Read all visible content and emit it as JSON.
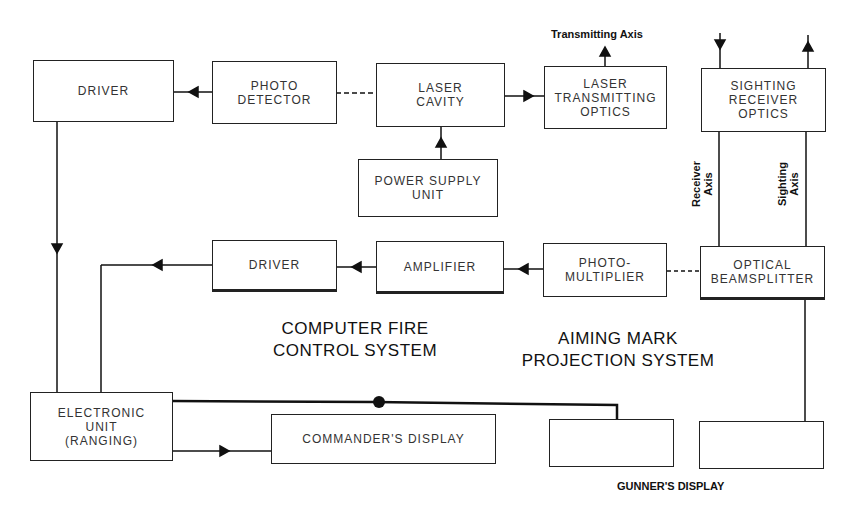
{
  "diagram": {
    "blocks": {
      "driver_top": "DRIVER",
      "photo_detector": "PHOTO\nDETECTOR",
      "laser_cavity": "LASER\nCAVITY",
      "laser_transmitting_optics": "LASER\nTRANSMITTING\nOPTICS",
      "sighting_receiver_optics": "SIGHTING\nRECEIVER\nOPTICS",
      "power_supply_unit": "POWER SUPPLY\nUNIT",
      "driver_mid": "DRIVER",
      "amplifier": "AMPLIFIER",
      "photo_multiplier": "PHOTO-\nMULTIPLIER",
      "optical_beamsplitter": "OPTICAL\nBEAMSPLITTER",
      "electronic_unit": "ELECTRONIC\nUNIT\n(RANGING)",
      "commanders_display": "COMMANDER'S DISPLAY",
      "gunner_display_left": "",
      "gunner_display_right": ""
    },
    "labels": {
      "transmitting_axis": "Transmitting Axis",
      "receiver_axis": "Receiver\nAxis",
      "sighting_axis": "Sighting\nAxis",
      "computer_fire_control": "COMPUTER FIRE\nCONTROL SYSTEM",
      "aiming_mark_projection": "AIMING MARK\nPROJECTION SYSTEM",
      "gunners_display": "GUNNER'S DISPLAY"
    }
  }
}
